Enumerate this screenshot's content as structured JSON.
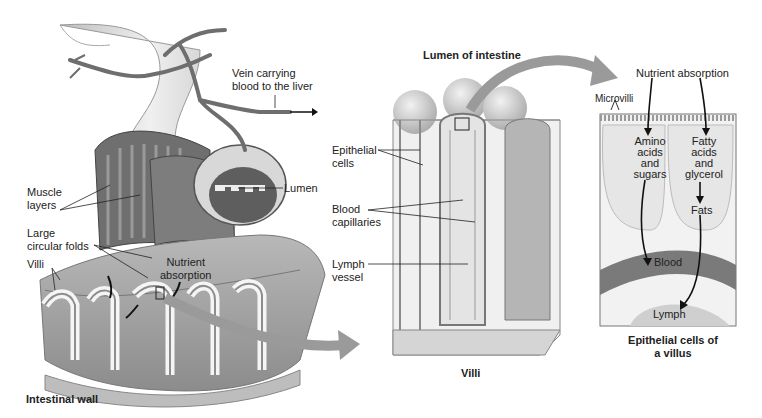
{
  "panels": {
    "intestinal_wall": {
      "title": "Intestinal wall",
      "labels": {
        "vein": [
          "Vein carrying",
          "blood to the liver"
        ],
        "lumen": "Lumen",
        "muscle": [
          "Muscle",
          "layers"
        ],
        "folds": [
          "Large",
          "circular folds"
        ],
        "villi": "Villi",
        "nutrient": [
          "Nutrient",
          "absorption"
        ]
      }
    },
    "villi": {
      "top_title": "Lumen of intestine",
      "title": "Villi",
      "labels": {
        "epithelial": [
          "Epithelial",
          "cells"
        ],
        "capillaries": [
          "Blood",
          "capillaries"
        ],
        "lymph": [
          "Lymph",
          "vessel"
        ]
      }
    },
    "epithelial": {
      "title": [
        "Epithelial cells of",
        "a villus"
      ],
      "labels": {
        "nutrient": "Nutrient absorption",
        "microvilli": "Microvilli",
        "amino": [
          "Amino",
          "acids",
          "and",
          "sugars"
        ],
        "fatty": [
          "Fatty",
          "acids",
          "and",
          "glycerol"
        ],
        "fats": "Fats",
        "blood": "Blood",
        "lymph": "Lymph"
      }
    }
  },
  "colors": {
    "tissue": "#c9c9c9",
    "tissue_dark": "#8a8a8a",
    "arrow": "#9a9a9a",
    "line": "#333333"
  }
}
